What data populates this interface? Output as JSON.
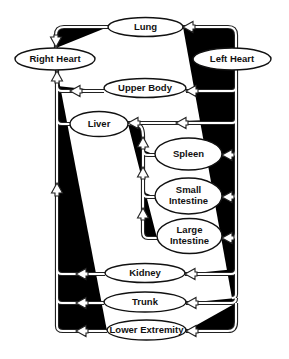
{
  "diagram": {
    "title": "",
    "nodes": {
      "lung": {
        "label": "Lung"
      },
      "right_heart": {
        "label": "Right Heart"
      },
      "left_heart": {
        "label": "Left Heart"
      },
      "upper_body": {
        "label": "Upper Body"
      },
      "liver": {
        "label": "Liver"
      },
      "spleen": {
        "label": "Spleen"
      },
      "small_intestine": {
        "label1": "Small",
        "label2": "Intestine"
      },
      "large_intestine": {
        "label1": "Large",
        "label2": "Intestine"
      },
      "kidney": {
        "label": "Kidney"
      },
      "trunk": {
        "label": "Trunk"
      },
      "lower_extremity": {
        "label": "Lower Extremity"
      }
    },
    "edges": [
      {
        "from": "Left Heart",
        "to": "Lung"
      },
      {
        "from": "Lung",
        "to": "Right Heart"
      },
      {
        "from": "Left Heart",
        "to": "Upper Body"
      },
      {
        "from": "Upper Body",
        "to": "Right Heart"
      },
      {
        "from": "Left Heart",
        "to": "Liver"
      },
      {
        "from": "Left Heart",
        "to": "Spleen"
      },
      {
        "from": "Left Heart",
        "to": "Small Intestine"
      },
      {
        "from": "Left Heart",
        "to": "Large Intestine"
      },
      {
        "from": "Spleen",
        "to": "Liver"
      },
      {
        "from": "Small Intestine",
        "to": "Liver"
      },
      {
        "from": "Large Intestine",
        "to": "Liver"
      },
      {
        "from": "Liver",
        "to": "Right Heart"
      },
      {
        "from": "Left Heart",
        "to": "Kidney"
      },
      {
        "from": "Kidney",
        "to": "Right Heart"
      },
      {
        "from": "Left Heart",
        "to": "Trunk"
      },
      {
        "from": "Trunk",
        "to": "Right Heart"
      },
      {
        "from": "Left Heart",
        "to": "Lower Extremity"
      },
      {
        "from": "Lower Extremity",
        "to": "Right Heart"
      }
    ]
  }
}
